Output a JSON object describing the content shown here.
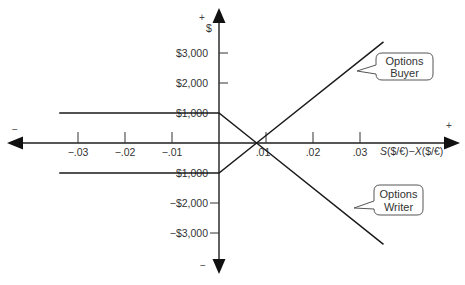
{
  "chart_data": {
    "type": "line",
    "title": "",
    "xlabel": "S($/€)−X($/€)",
    "xlabel_parts": [
      "S",
      "($/€)−",
      "X",
      "($/€)"
    ],
    "ylabel": "$",
    "xlim": [
      -0.034,
      0.035
    ],
    "ylim": [
      -3375,
      3375
    ],
    "grid": false,
    "legend": "callouts",
    "x_ticks": [
      {
        "value": -0.03,
        "label": "−.03"
      },
      {
        "value": -0.02,
        "label": "−.02"
      },
      {
        "value": -0.01,
        "label": "−.01"
      },
      {
        "value": 0.01,
        "label": ".01"
      },
      {
        "value": 0.02,
        "label": ".02"
      },
      {
        "value": 0.03,
        "label": ".03"
      }
    ],
    "y_ticks": [
      {
        "value": 3000,
        "label": "$3,000"
      },
      {
        "value": 2000,
        "label": "$2,000"
      },
      {
        "value": 1000,
        "label": "$1,000"
      },
      {
        "value": -1000,
        "label": "$1,000"
      },
      {
        "value": -2000,
        "label": "−$2,000"
      },
      {
        "value": -3000,
        "label": "−$3,000"
      }
    ],
    "series": [
      {
        "name": "Options Buyer",
        "points": [
          [
            -0.034,
            -1000
          ],
          [
            0,
            -1000
          ],
          [
            0.008,
            0
          ],
          [
            0.035,
            3375
          ]
        ]
      },
      {
        "name": "Options Writer",
        "points": [
          [
            -0.034,
            1000
          ],
          [
            0,
            1000
          ],
          [
            0.008,
            0
          ],
          [
            0.035,
            -3375
          ]
        ]
      }
    ],
    "annotations": [
      {
        "text": "Options Buyer",
        "lines": [
          "Options",
          "Buyer"
        ]
      },
      {
        "text": "Options Writer",
        "lines": [
          "Options",
          "Writer"
        ]
      }
    ],
    "axis_signs": {
      "y_top": "+",
      "y_bottom": "−",
      "x_left": "−",
      "x_right": "+"
    }
  }
}
